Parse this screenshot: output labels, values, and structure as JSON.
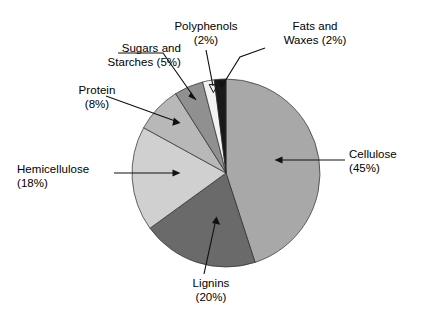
{
  "chart_data": {
    "type": "pie",
    "title": "",
    "subtitle": "",
    "xlabel": "",
    "ylabel": "",
    "legend_position": "none",
    "grid": false,
    "units": "percent",
    "start_angle_deg": 0,
    "direction": "clockwise",
    "categories": [
      "Cellulose",
      "Lignins",
      "Hemicellulose",
      "Protein",
      "Sugars and Starches",
      "Polyphenols",
      "Fats and Waxes"
    ],
    "values": [
      45,
      20,
      18,
      8,
      5,
      2,
      2
    ],
    "slices": [
      {
        "name": "Cellulose",
        "value": 45,
        "percent_label": "(45%)",
        "color": "#a8a8a8",
        "label_lines": [
          "Cellulose",
          "(45%)"
        ]
      },
      {
        "name": "Lignins",
        "value": 20,
        "percent_label": "(20%)",
        "color": "#6a6a6a",
        "label_lines": [
          "Lignins",
          "(20%)"
        ]
      },
      {
        "name": "Hemicellulose",
        "value": 18,
        "percent_label": "(18%)",
        "color": "#d0d0d0",
        "label_lines": [
          "Hemicellulose",
          "(18%)"
        ]
      },
      {
        "name": "Protein",
        "value": 8,
        "percent_label": "(8%)",
        "color": "#b8b8b8",
        "label_lines": [
          "Protein",
          "(8%)"
        ]
      },
      {
        "name": "Sugars and Starches",
        "value": 5,
        "percent_label": "(5%)",
        "color": "#909090",
        "label_lines": [
          "Sugars and",
          "Starches (5%)"
        ]
      },
      {
        "name": "Polyphenols",
        "value": 2,
        "percent_label": "(2%)",
        "color": "#f2f2f2",
        "label_lines": [
          "Polyphenols",
          "(2%)"
        ]
      },
      {
        "name": "Fats and Waxes",
        "value": 2,
        "percent_label": "(2%)",
        "color": "#191919",
        "label_lines": [
          "Fats and",
          "Waxes (2%)"
        ]
      }
    ],
    "total": 100
  },
  "labels": {
    "cellulose": {
      "line1": "Cellulose",
      "line2": "(45%)"
    },
    "lignins": {
      "line1": "Lignins",
      "line2": "(20%)"
    },
    "hemicellulose": {
      "line1": "Hemicellulose",
      "line2": "(18%)"
    },
    "protein": {
      "line1": "Protein",
      "line2": "(8%)"
    },
    "sugars": {
      "line1": "Sugars and",
      "line2": "Starches (5%)"
    },
    "polyphenols": {
      "line1": "Polyphenols",
      "line2": "(2%)"
    },
    "fats": {
      "line1": "Fats and",
      "line2": "Waxes (2%)"
    }
  },
  "colors": {
    "background": "#ffffff",
    "outline": "#2b2b2b",
    "leader": "#111111",
    "text": "#000000"
  }
}
